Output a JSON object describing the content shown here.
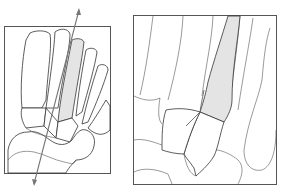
{
  "figure": {
    "caption_fragment": "",
    "panels": [
      {
        "id": "left",
        "description": "Dorsal view of foot skeleton with axis line through the second metatarsal",
        "highlight_color": "#e4e4e4",
        "frame_color": "#555555",
        "axis_color": "#777777"
      },
      {
        "id": "right",
        "description": "Magnified view of second metatarsal base and tarsometatarsal joint",
        "highlight_color": "#e4e4e4",
        "frame_color": "#555555"
      }
    ]
  }
}
